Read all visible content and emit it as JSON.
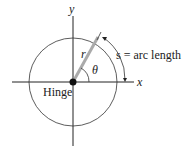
{
  "diagram": {
    "axis_x_label": "x",
    "axis_y_label": "y",
    "radius_label": "r",
    "angle_label": "θ",
    "arc_label": "s = arc length",
    "hinge_label": "Hinge"
  }
}
